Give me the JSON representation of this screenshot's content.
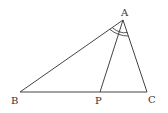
{
  "diagram": {
    "title": "",
    "points": {
      "A": {
        "label": "A",
        "x": 123,
        "y": 20
      },
      "B": {
        "label": "B",
        "x": 20,
        "y": 92
      },
      "P": {
        "label": "P",
        "x": 100,
        "y": 92
      },
      "C": {
        "label": "C",
        "x": 147,
        "y": 92
      }
    },
    "segments": [
      "AB",
      "AC",
      "BC",
      "AP"
    ],
    "angle_marks": {
      "description": "double arc at A marking angle BAP equal to angle PAC",
      "vertex": "A"
    },
    "colors": {
      "line": "#444444",
      "label": "#333333",
      "background": "#ffffff"
    }
  }
}
